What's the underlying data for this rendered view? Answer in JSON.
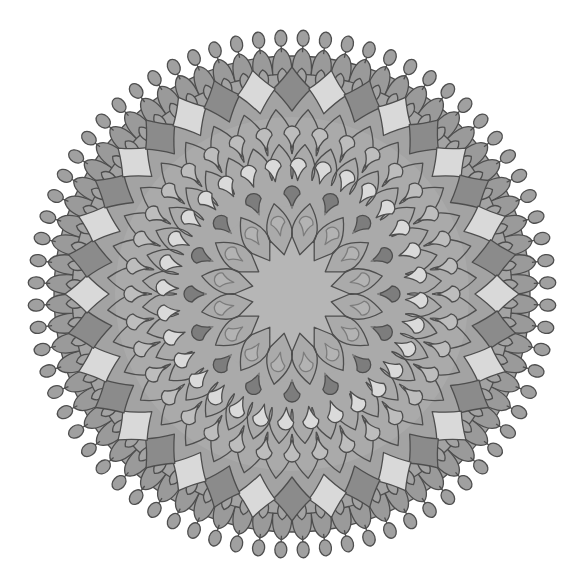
{
  "image": {
    "subject": "grayscale mandala coloring design",
    "width": 569,
    "height": 587,
    "background": "#ffffff"
  },
  "mandala": {
    "center": [
      292,
      294
    ],
    "colors": {
      "outline": "#4e4e4e",
      "base": "#a3a3a3",
      "base_mid": "#aaaaaa",
      "center_star": "#b6b6b6",
      "diamond_light": "#d9d9d9",
      "diamond_dark": "#8b8b8b",
      "teardrop_light": "#dadada",
      "teardrop_dark": "#7d7d7d",
      "teardrop_mid": "#bdbdbd",
      "scallop": "#9a9a9a",
      "tip": "#a0a0a0"
    },
    "center_star": {
      "points": 16,
      "inner_radius": 40,
      "outer_radius": 58
    },
    "petal_ring_inner": {
      "count": 16,
      "inner_radius": 55,
      "outer_radius": 92
    },
    "teardrop_rings": [
      {
        "name": "inner-teardrops",
        "count": 16,
        "radius": 72,
        "size": 7,
        "tone": "teardrop_mid",
        "offset": 0.5
      },
      {
        "name": "dark-teardrops",
        "count": 16,
        "radius": 100,
        "size": 8,
        "tone": "teardrop_dark",
        "offset": 0.0
      },
      {
        "name": "light-teardrops",
        "count": 32,
        "radius": 128,
        "size": 8,
        "tone": "teardrop_light",
        "offset": 0.25
      },
      {
        "name": "outer-teardrops",
        "count": 36,
        "radius": 160,
        "size": 8,
        "tone": "teardrop_mid",
        "offset": 0.0
      }
    ],
    "petal_ring_outer": {
      "count": 36,
      "inner_radius": 140,
      "outer_radius": 185
    },
    "diamond_ring": {
      "count": 36,
      "radius": 205,
      "half_width": 19,
      "half_height": 22,
      "pattern": [
        "diamond_dark",
        "diamond_light"
      ]
    },
    "scallop_ring": {
      "count": 72,
      "inner_radius": 220,
      "outer_radius": 242
    },
    "tip_ring": {
      "count": 72,
      "stem_radius": 242,
      "bulb_radius": 256,
      "bulb_size": 7
    },
    "body_radius": 238
  }
}
